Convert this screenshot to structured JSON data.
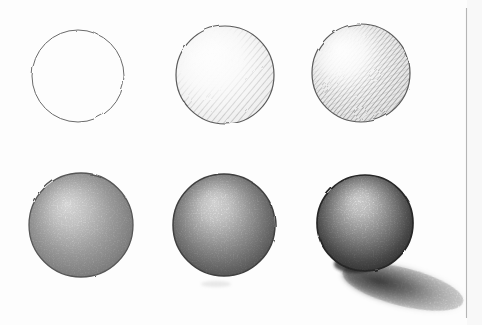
{
  "page": {
    "background_color": "#fdfdfd",
    "page_edge_color": "#b5b5b5"
  },
  "drawing": {
    "subject": "pencil-sphere-shading-tutorial-six-steps",
    "medium": "graphite pencil on white paper",
    "grid": {
      "rows": 2,
      "cols": 3
    },
    "pencil_light_color": "#8b8b8b",
    "pencil_mid_color": "#6f6f6f",
    "pencil_dark_color": "#2a2a2a",
    "steps": [
      {
        "step": 1,
        "name": "plain circle outline",
        "shading": "none",
        "cx": 78,
        "cy": 76,
        "r": 46
      },
      {
        "step": 2,
        "name": "light diagonal hatching",
        "shading": "light-hatch",
        "cx": 225,
        "cy": 75,
        "r": 49
      },
      {
        "step": 3,
        "name": "denser hatching",
        "shading": "dense-hatch",
        "cx": 361,
        "cy": 73,
        "r": 49
      },
      {
        "step": 4,
        "name": "soft tonal shading",
        "shading": "soft-tone",
        "cx": 81,
        "cy": 225,
        "r": 52
      },
      {
        "step": 5,
        "name": "stronger core shadow",
        "shading": "strong-tone",
        "cx": 224,
        "cy": 225,
        "r": 51
      },
      {
        "step": 6,
        "name": "full rendering with cast shadow",
        "shading": "full-tone",
        "cx": 365,
        "cy": 223,
        "r": 48,
        "cast_shadow": {
          "cx": 403,
          "cy": 287,
          "rx": 62,
          "ry": 19,
          "rotate_deg": 14
        }
      }
    ]
  }
}
